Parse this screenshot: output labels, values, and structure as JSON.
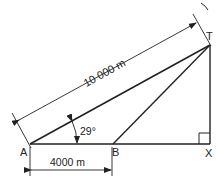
{
  "diagram": {
    "type": "geometry-right-triangle",
    "points": {
      "A": {
        "label": "A"
      },
      "B": {
        "label": "B"
      },
      "X": {
        "label": "X"
      },
      "T": {
        "label": "T"
      }
    },
    "dimensions": {
      "AT": "10 000 m",
      "AB": "4000 m"
    },
    "angle_TAX": "29°",
    "right_angle_at": "X",
    "line_color": "#222222"
  }
}
